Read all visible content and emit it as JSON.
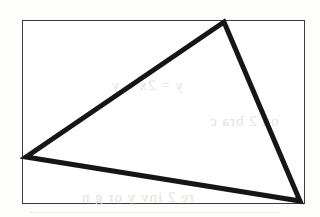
{
  "figure": {
    "background_color": "#fdfdfc",
    "frame": {
      "border_color": "#3b3b3e",
      "fill_color": "#ffffff",
      "border_width_px": 1.5,
      "x": 22,
      "y": 20,
      "width": 283,
      "height": 184
    },
    "shape": {
      "name": "triangle",
      "stroke_color": "#161616",
      "fill": "none",
      "stroke_width_px": 5,
      "vertices": [
        {
          "label": "apex",
          "x": 224,
          "y": 22
        },
        {
          "label": "left",
          "x": 26,
          "y": 157
        },
        {
          "label": "bottom-right",
          "x": 300,
          "y": 201
        }
      ],
      "points_attr": "224,22 26,157 300,201"
    },
    "ghost_text": {
      "description": "faint bleed-through text from reverse side of scanned page",
      "color": "#e4e0da",
      "line_1": "y = 2x + y",
      "line_2": "on 2 bra c",
      "line_3": "re 2 inv y or g n"
    }
  }
}
